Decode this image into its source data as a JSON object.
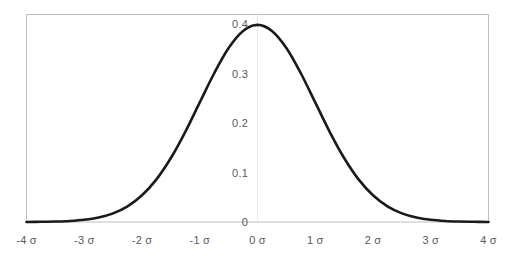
{
  "chart_data": {
    "type": "line",
    "title": "",
    "subtitle": "",
    "xlabel": "",
    "ylabel": "",
    "xlim": [
      -4,
      4
    ],
    "ylim": [
      0,
      0.42
    ],
    "grid": false,
    "legend": null,
    "curve_color": "#1a1a1a",
    "curve_width_px": 2.6,
    "border_color": "#bfbfbf",
    "gridline_color": "#e8e8e8",
    "tick_text_color": "#595959",
    "x_ticks": [
      {
        "value": -4,
        "label": "-4 σ"
      },
      {
        "value": -3,
        "label": "-3 σ"
      },
      {
        "value": -2,
        "label": "-2 σ"
      },
      {
        "value": -1,
        "label": "-1 σ"
      },
      {
        "value": 0,
        "label": "0 σ"
      },
      {
        "value": 1,
        "label": "1 σ"
      },
      {
        "value": 2,
        "label": "2 σ"
      },
      {
        "value": 3,
        "label": "3 σ"
      },
      {
        "value": 4,
        "label": "4 σ"
      }
    ],
    "y_ticks": [
      {
        "value": 0,
        "label": "0"
      },
      {
        "value": 0.1,
        "label": "0.1"
      },
      {
        "value": 0.2,
        "label": "0.2"
      },
      {
        "value": 0.3,
        "label": "0.3"
      },
      {
        "value": 0.4,
        "label": "0.4"
      }
    ],
    "vertical_gridlines": [
      0
    ],
    "series": [
      {
        "name": "Normal density",
        "x": [
          -4,
          -3.75,
          -3.5,
          -3.25,
          -3,
          -2.75,
          -2.5,
          -2.25,
          -2,
          -1.75,
          -1.5,
          -1.25,
          -1,
          -0.75,
          -0.5,
          -0.25,
          0,
          0.25,
          0.5,
          0.75,
          1,
          1.25,
          1.5,
          1.75,
          2,
          2.25,
          2.5,
          2.75,
          3,
          3.25,
          3.5,
          3.75,
          4
        ],
        "y": [
          0.0001,
          0.0004,
          0.0009,
          0.002,
          0.0044,
          0.0091,
          0.0175,
          0.0317,
          0.054,
          0.0863,
          0.1295,
          0.1826,
          0.242,
          0.3011,
          0.3521,
          0.3867,
          0.3989,
          0.3867,
          0.3521,
          0.3011,
          0.242,
          0.1826,
          0.1295,
          0.0863,
          0.054,
          0.0317,
          0.0175,
          0.0091,
          0.0044,
          0.002,
          0.0009,
          0.0004,
          0.0001
        ]
      }
    ]
  }
}
